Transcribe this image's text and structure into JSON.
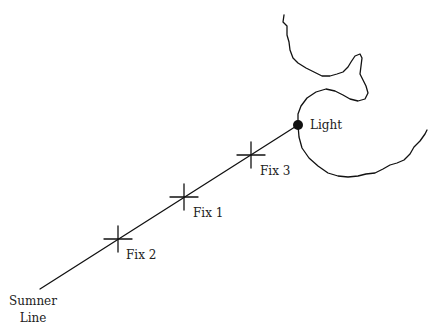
{
  "diagram": {
    "sumner_line": {
      "label_line1": "Sumner",
      "label_line2": "Line",
      "start": [
        40,
        289
      ],
      "end": [
        298,
        125
      ]
    },
    "fixes": [
      {
        "label": "Fix 2",
        "x": 118,
        "y": 239
      },
      {
        "label": "Fix 1",
        "x": 184,
        "y": 197
      },
      {
        "label": "Fix 3",
        "x": 251,
        "y": 155
      }
    ],
    "light": {
      "label": "Light",
      "x": 298,
      "y": 125,
      "radius": 5
    },
    "colors": {
      "ink": "#111111",
      "background": "#ffffff"
    }
  }
}
